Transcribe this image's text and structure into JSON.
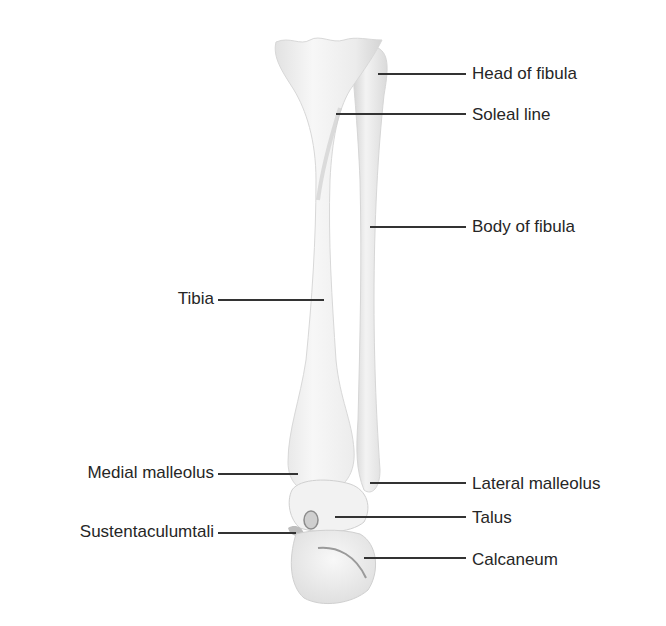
{
  "diagram": {
    "structures": [
      "Tibia",
      "Fibula",
      "Talus",
      "Calcaneum"
    ],
    "colors": {
      "bone_light": "#f4f4f4",
      "bone_shade": "#cfcfcf",
      "leader": "#333333",
      "text": "#262626"
    }
  },
  "labels": {
    "right": [
      {
        "text": "Head of fibula",
        "x": 472,
        "y": 64,
        "line_x1": 378,
        "line_x2": 466,
        "line_y": 74
      },
      {
        "text": "Soleal line",
        "x": 472,
        "y": 106,
        "line_x1": 336,
        "line_x2": 466,
        "line_y": 114
      },
      {
        "text": "Body of fibula",
        "x": 472,
        "y": 217,
        "line_x1": 370,
        "line_x2": 466,
        "line_y": 227
      },
      {
        "text": "Lateral malleolus",
        "x": 472,
        "y": 474,
        "line_x1": 370,
        "line_x2": 466,
        "line_y": 483
      },
      {
        "text": "Talus",
        "x": 472,
        "y": 509,
        "line_x1": 335,
        "line_x2": 466,
        "line_y": 517
      },
      {
        "text": "Calcaneum",
        "x": 472,
        "y": 551,
        "line_x1": 364,
        "line_x2": 466,
        "line_y": 558
      }
    ],
    "left": [
      {
        "text": "Tibia",
        "x": 212,
        "y": 289,
        "line_x1": 218,
        "line_x2": 324,
        "line_y": 300
      },
      {
        "text": "Medial malleolus",
        "x": 212,
        "y": 463,
        "line_x1": 218,
        "line_x2": 298,
        "line_y": 473
      },
      {
        "text": "Sustentaculumtali",
        "x": 212,
        "y": 522,
        "line_x1": 218,
        "line_x2": 296,
        "line_y": 532
      }
    ]
  }
}
